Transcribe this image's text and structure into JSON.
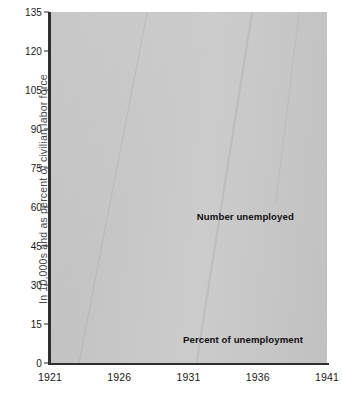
{
  "chart_data": {
    "type": "line",
    "title": "",
    "subtitle": "",
    "xlabel": "",
    "ylabel": "In 10,000s and as percent of civilian labor force",
    "xlim": [
      1921,
      1941
    ],
    "ylim": [
      0,
      135
    ],
    "ytick_values": [
      0,
      15,
      30,
      45,
      60,
      75,
      90,
      105,
      120,
      135
    ],
    "ytick_labels": [
      "0",
      "15",
      "30",
      "45",
      "60",
      "75",
      "90",
      "105",
      "120",
      "135"
    ],
    "xtick_values": [
      1921,
      1926,
      1931,
      1936,
      1941
    ],
    "xtick_labels": [
      "1921",
      "1926",
      "1931",
      "1936",
      "1941"
    ],
    "grid": "horizontal-and-vertical-white",
    "legend_position": "inline-annotations",
    "plot_background_color": "#c9c9c9",
    "line_color": "#101010",
    "grid_color": "#ffffff",
    "x": [
      1921,
      1922,
      1923,
      1924,
      1925,
      1926,
      1927,
      1928,
      1929,
      1930,
      1931,
      1932,
      1933,
      1934,
      1935,
      1936,
      1937,
      1938,
      1939,
      1940,
      1941
    ],
    "series": [
      {
        "name": "Number unemployed",
        "style": "solid",
        "values": [
          49,
          31,
          13,
          25,
          17,
          8,
          15,
          20,
          18,
          15,
          70,
          126,
          128,
          113,
          104,
          90,
          78,
          105,
          92,
          73,
          54
        ]
      },
      {
        "name": "Percent of unemployment",
        "style": "dashed",
        "values": [
          11,
          7.5,
          4,
          6,
          5,
          3.5,
          4.5,
          5,
          5,
          4,
          9,
          18,
          26,
          22,
          21,
          17,
          15,
          20,
          17,
          14,
          10
        ]
      }
    ],
    "annotations": [
      {
        "text": "Number unemployed",
        "x": 1931.6,
        "y": 56
      },
      {
        "text": "Percent of unemployment",
        "x": 1930.6,
        "y": 9
      }
    ]
  }
}
